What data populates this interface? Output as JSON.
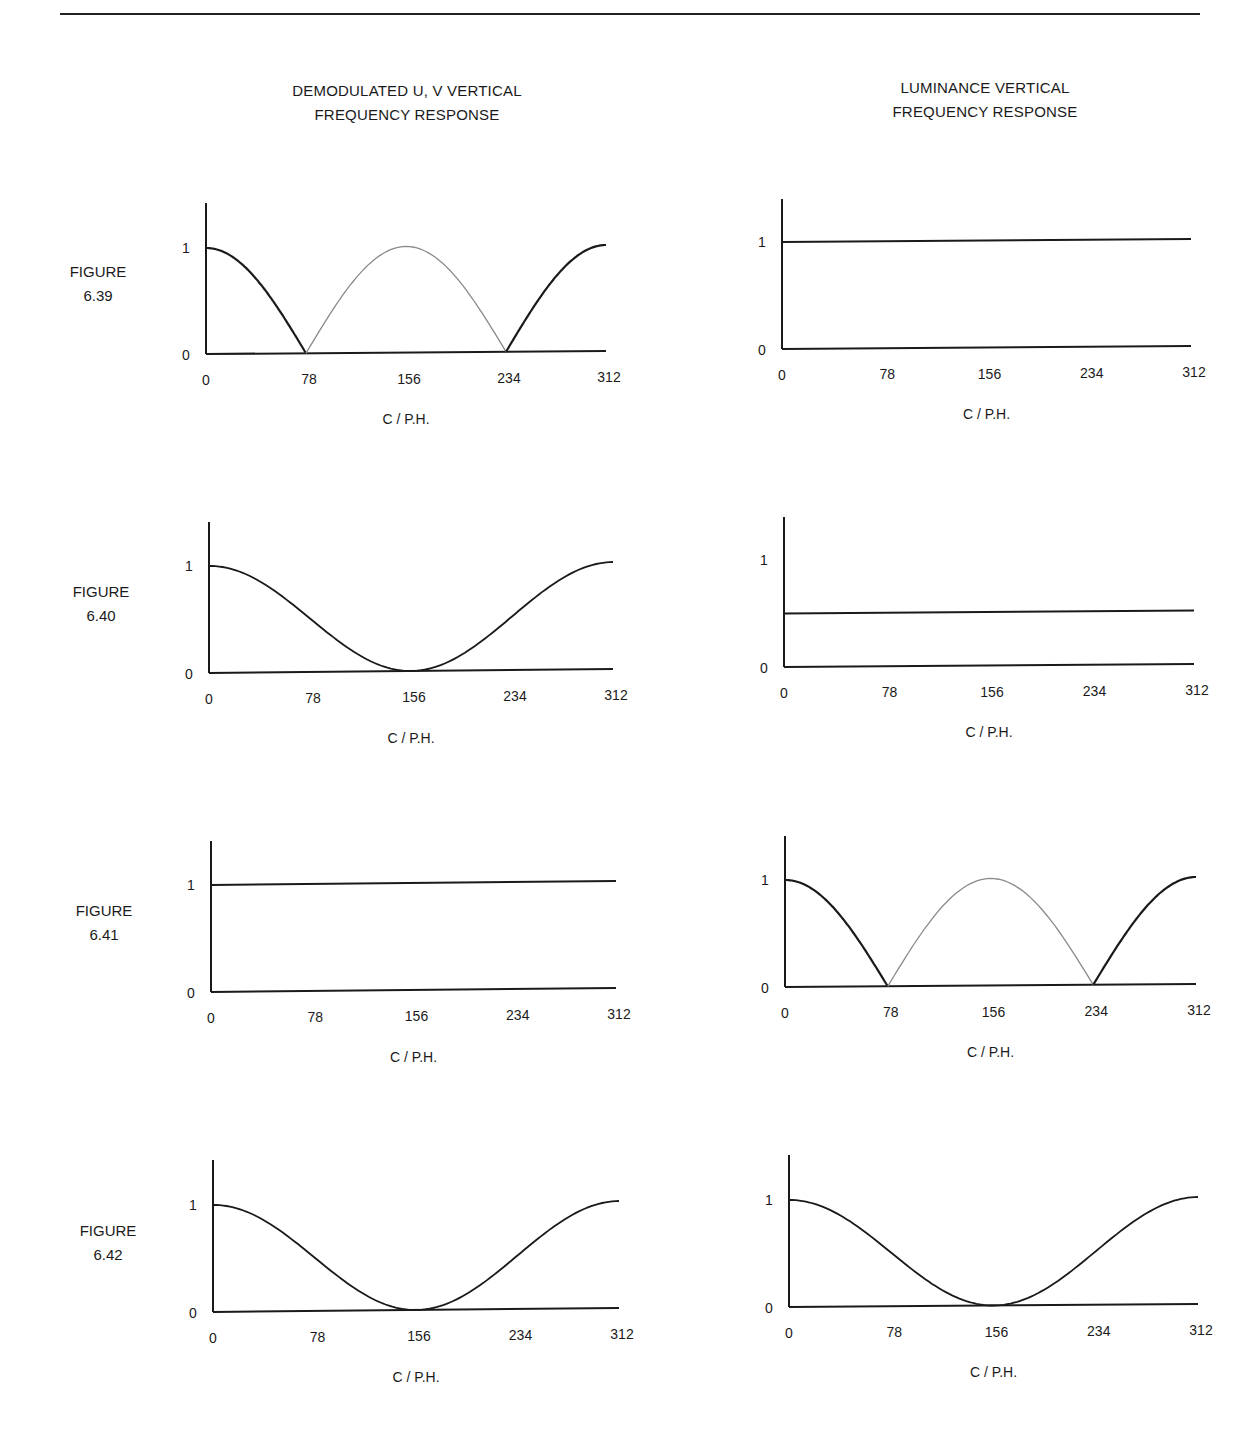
{
  "columns": {
    "left": {
      "title_line1": "DEMODULATED U, V VERTICAL",
      "title_line2": "FREQUENCY RESPONSE"
    },
    "right": {
      "title_line1": "LUMINANCE VERTICAL",
      "title_line2": "FREQUENCY RESPONSE"
    }
  },
  "figures": [
    {
      "label_line1": "FIGURE",
      "label_line2": "6.39"
    },
    {
      "label_line1": "FIGURE",
      "label_line2": "6.40"
    },
    {
      "label_line1": "FIGURE",
      "label_line2": "6.41"
    },
    {
      "label_line1": "FIGURE",
      "label_line2": "6.42"
    }
  ],
  "axis": {
    "x_ticks": [
      "0",
      "78",
      "156",
      "234",
      "312"
    ],
    "y_ticks": [
      "0",
      "1"
    ],
    "xlabel": "C / P.H."
  },
  "colors": {
    "ink": "#1a1a1a",
    "alias_lobe": "#8a8a8a"
  },
  "chart_data": [
    {
      "type": "line",
      "figure": "6.39",
      "panel": "DEMODULATED U, V VERTICAL FREQUENCY RESPONSE",
      "xlabel": "C / P.H.",
      "ylabel": "",
      "xlim": [
        0,
        312
      ],
      "ylim": [
        0,
        1.4
      ],
      "x_ticks": [
        0,
        78,
        156,
        234,
        312
      ],
      "y_ticks": [
        0,
        1
      ],
      "series": [
        {
          "name": "response",
          "style": "solid",
          "x": [
            0,
            20,
            40,
            60,
            78
          ],
          "values": [
            1.0,
            0.89,
            0.66,
            0.36,
            0.0
          ]
        },
        {
          "name": "alias lobe",
          "style": "light",
          "x": [
            78,
            100,
            120,
            156,
            192,
            212,
            234
          ],
          "values": [
            0.0,
            0.43,
            0.75,
            1.0,
            0.75,
            0.43,
            0.0
          ]
        },
        {
          "name": "response",
          "style": "solid",
          "x": [
            234,
            252,
            272,
            292,
            312
          ],
          "values": [
            0.0,
            0.36,
            0.66,
            0.89,
            1.0
          ]
        }
      ]
    },
    {
      "type": "line",
      "figure": "6.39",
      "panel": "LUMINANCE VERTICAL FREQUENCY RESPONSE",
      "xlabel": "C / P.H.",
      "xlim": [
        0,
        312
      ],
      "ylim": [
        0,
        1.4
      ],
      "x_ticks": [
        0,
        78,
        156,
        234,
        312
      ],
      "y_ticks": [
        0,
        1
      ],
      "series": [
        {
          "name": "response",
          "x": [
            0,
            312
          ],
          "values": [
            1.0,
            1.0
          ]
        }
      ]
    },
    {
      "type": "line",
      "figure": "6.40",
      "panel": "DEMODULATED U, V VERTICAL FREQUENCY RESPONSE",
      "xlabel": "C / P.H.",
      "xlim": [
        0,
        312
      ],
      "ylim": [
        0,
        1.4
      ],
      "x_ticks": [
        0,
        78,
        156,
        234,
        312
      ],
      "y_ticks": [
        0,
        1
      ],
      "series": [
        {
          "name": "response (cos²)",
          "x": [
            0,
            39,
            78,
            117,
            156,
            195,
            234,
            273,
            312
          ],
          "values": [
            1.0,
            0.85,
            0.5,
            0.15,
            0.0,
            0.15,
            0.5,
            0.85,
            1.0
          ]
        }
      ]
    },
    {
      "type": "line",
      "figure": "6.40",
      "panel": "LUMINANCE VERTICAL FREQUENCY RESPONSE",
      "xlabel": "C / P.H.",
      "xlim": [
        0,
        312
      ],
      "ylim": [
        0,
        1.4
      ],
      "x_ticks": [
        0,
        78,
        156,
        234,
        312
      ],
      "y_ticks": [
        0,
        1
      ],
      "series": [
        {
          "name": "response",
          "x": [
            0,
            312
          ],
          "values": [
            0.5,
            0.5
          ]
        }
      ]
    },
    {
      "type": "line",
      "figure": "6.41",
      "panel": "DEMODULATED U, V VERTICAL FREQUENCY RESPONSE",
      "xlabel": "C / P.H.",
      "xlim": [
        0,
        312
      ],
      "ylim": [
        0,
        1.4
      ],
      "x_ticks": [
        0,
        78,
        156,
        234,
        312
      ],
      "y_ticks": [
        0,
        1
      ],
      "series": [
        {
          "name": "response",
          "x": [
            0,
            312
          ],
          "values": [
            1.0,
            1.0
          ]
        }
      ]
    },
    {
      "type": "line",
      "figure": "6.41",
      "panel": "LUMINANCE VERTICAL FREQUENCY RESPONSE",
      "xlabel": "C / P.H.",
      "xlim": [
        0,
        312
      ],
      "ylim": [
        0,
        1.4
      ],
      "x_ticks": [
        0,
        78,
        156,
        234,
        312
      ],
      "y_ticks": [
        0,
        1
      ],
      "series": [
        {
          "name": "response",
          "style": "solid",
          "x": [
            0,
            20,
            40,
            60,
            78
          ],
          "values": [
            1.0,
            0.89,
            0.66,
            0.36,
            0.0
          ]
        },
        {
          "name": "alias lobe",
          "style": "light",
          "x": [
            78,
            100,
            120,
            156,
            192,
            212,
            234
          ],
          "values": [
            0.0,
            0.43,
            0.75,
            1.0,
            0.75,
            0.43,
            0.0
          ]
        },
        {
          "name": "response",
          "style": "solid",
          "x": [
            234,
            252,
            272,
            292,
            312
          ],
          "values": [
            0.0,
            0.36,
            0.66,
            0.89,
            1.0
          ]
        }
      ]
    },
    {
      "type": "line",
      "figure": "6.42",
      "panel": "DEMODULATED U, V VERTICAL FREQUENCY RESPONSE",
      "xlabel": "C / P.H.",
      "xlim": [
        0,
        312
      ],
      "ylim": [
        0,
        1.4
      ],
      "x_ticks": [
        0,
        78,
        156,
        234,
        312
      ],
      "y_ticks": [
        0,
        1
      ],
      "series": [
        {
          "name": "response (cos²)",
          "x": [
            0,
            39,
            78,
            117,
            156,
            195,
            234,
            273,
            312
          ],
          "values": [
            1.0,
            0.85,
            0.5,
            0.15,
            0.0,
            0.15,
            0.5,
            0.85,
            1.0
          ]
        }
      ]
    },
    {
      "type": "line",
      "figure": "6.42",
      "panel": "LUMINANCE VERTICAL FREQUENCY RESPONSE",
      "xlabel": "C / P.H.",
      "xlim": [
        0,
        312
      ],
      "ylim": [
        0,
        1.4
      ],
      "x_ticks": [
        0,
        78,
        156,
        234,
        312
      ],
      "y_ticks": [
        0,
        1
      ],
      "series": [
        {
          "name": "response (cos²)",
          "x": [
            0,
            39,
            78,
            117,
            156,
            195,
            234,
            273,
            312
          ],
          "values": [
            1.0,
            0.85,
            0.5,
            0.15,
            0.0,
            0.15,
            0.5,
            0.85,
            1.0
          ]
        }
      ]
    }
  ]
}
